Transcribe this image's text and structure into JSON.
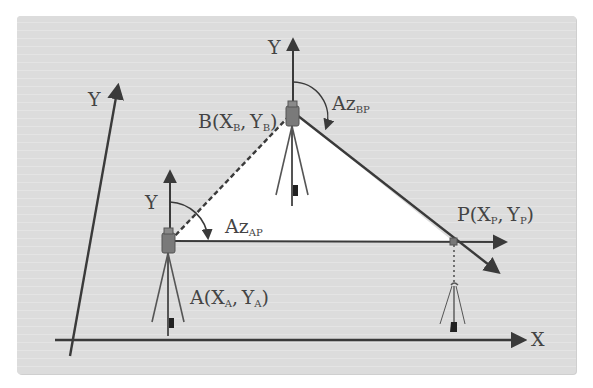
{
  "diagram": {
    "type": "survey-resection-coordinate-diagram",
    "colors": {
      "panel_background": "#dcdcdc",
      "page_background": "#ffffff",
      "lines": "#3a3a3a",
      "triangle_fill": "#ffffff",
      "text": "#444444"
    },
    "axes": {
      "global_x_label": "X",
      "global_y_label": "Y"
    },
    "points": {
      "A": {
        "name": "A",
        "x_sub": "A",
        "y_sub": "A",
        "label": "A(XA, YA)",
        "local_axis_label": "Y"
      },
      "B": {
        "name": "B",
        "x_sub": "B",
        "y_sub": "B",
        "label": "B(XB, YB)",
        "local_axis_label": "Y"
      },
      "P": {
        "name": "P",
        "x_sub": "P",
        "y_sub": "P",
        "label": "P(XP, YP)"
      }
    },
    "angles": {
      "az_ap": {
        "base": "Az",
        "sub": "AP",
        "label": "AzAP"
      },
      "az_bp": {
        "base": "Az",
        "sub": "BP",
        "label": "AzBP"
      }
    },
    "edges": [
      {
        "from": "A",
        "to": "B",
        "style": "dashed"
      },
      {
        "from": "A",
        "to": "P",
        "style": "solid-arrow"
      },
      {
        "from": "B",
        "to": "P",
        "style": "solid-arrow"
      }
    ]
  }
}
